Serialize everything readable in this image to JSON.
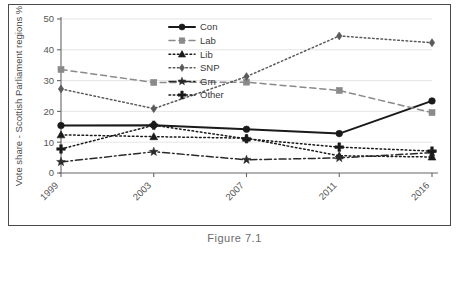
{
  "figure": {
    "caption": "Figure 7.1"
  },
  "chart_data": {
    "type": "line",
    "title": "",
    "xlabel": "",
    "ylabel": "Vote share - Scottish Parliament regions %",
    "categories": [
      "1999",
      "2003",
      "2007",
      "2011",
      "2016"
    ],
    "ylim": [
      0,
      50
    ],
    "yticks": [
      0,
      10,
      20,
      30,
      40,
      50
    ],
    "grid": "horizontal",
    "legend_position": "top-center",
    "xtick_rotation": -45,
    "series": [
      {
        "name": "Con",
        "values": [
          15.4,
          15.5,
          14.2,
          12.8,
          23.4
        ],
        "color": "#1a1a1a",
        "marker": "circle",
        "dash": "solid"
      },
      {
        "name": "Lab",
        "values": [
          33.6,
          29.4,
          29.5,
          26.8,
          19.6
        ],
        "color": "#8a8a8a",
        "marker": "square",
        "dash": "dashed"
      },
      {
        "name": "Lib",
        "values": [
          12.4,
          11.8,
          11.3,
          5.6,
          5.2
        ],
        "color": "#1a1a1a",
        "marker": "triangle",
        "dash": "dotted"
      },
      {
        "name": "SNP",
        "values": [
          27.3,
          20.9,
          31.3,
          44.5,
          42.3
        ],
        "color": "#5a5a5a",
        "marker": "diamond",
        "dash": "dotted"
      },
      {
        "name": "Grn",
        "values": [
          3.6,
          6.9,
          4.3,
          4.9,
          6.6
        ],
        "color": "#2a2a2a",
        "marker": "star",
        "dash": "dashdot"
      },
      {
        "name": "Other",
        "values": [
          7.8,
          15.5,
          11.1,
          8.4,
          7.1
        ],
        "color": "#1a1a1a",
        "marker": "plus",
        "dash": "dotted"
      }
    ]
  }
}
